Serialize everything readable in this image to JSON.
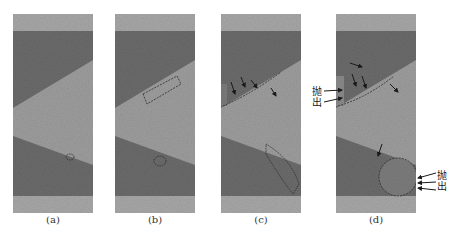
{
  "figure": {
    "panels": [
      {
        "id": "a",
        "label": "(a)"
      },
      {
        "id": "b",
        "label": "(b)"
      },
      {
        "id": "c",
        "label": "(c)"
      },
      {
        "id": "d",
        "label": "(d)"
      }
    ],
    "annotations": {
      "ejection_c": "抛出",
      "ejection_d_upper": "抛出",
      "ejection_d_lower": "抛出"
    },
    "colors": {
      "light_band": "#a7a7a7",
      "dark_layer": "#6b6b6b",
      "middle_wedge": "#9d9d9d",
      "outline": "#2a2a2a"
    }
  }
}
